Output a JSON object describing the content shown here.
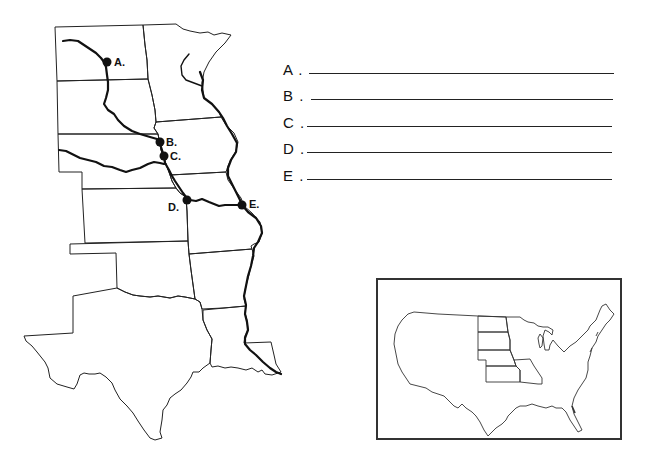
{
  "worksheet": {
    "map_points": [
      {
        "label": "A.",
        "x": 107,
        "y": 62
      },
      {
        "label": "B.",
        "x": 160,
        "y": 142
      },
      {
        "label": "C.",
        "x": 164,
        "y": 156
      },
      {
        "label": "D.",
        "x": 187,
        "y": 200
      },
      {
        "label": "E.",
        "x": 242,
        "y": 205
      }
    ],
    "answers": [
      {
        "letter": "A .",
        "value": ""
      },
      {
        "letter": "B .",
        "value": ""
      },
      {
        "letter": "C .",
        "value": ""
      },
      {
        "letter": "D .",
        "value": ""
      },
      {
        "letter": "E .",
        "value": ""
      }
    ]
  },
  "colors": {
    "line": "#222222",
    "river": "#111111",
    "background": "#ffffff"
  },
  "icons": {
    "dot": "location-dot-icon"
  }
}
